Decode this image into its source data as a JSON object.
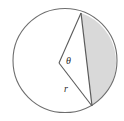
{
  "figure": {
    "kind": "geometry-diagram",
    "canvas": {
      "width": 124,
      "height": 121,
      "background": "#ffffff"
    },
    "colors": {
      "stroke": "#6e6e6e",
      "stroke_dark": "#4a4a4a",
      "circle_fill": "#ffffff",
      "segment_fill": "#d9d9d9",
      "label_color": "#2b2b2b"
    },
    "circle": {
      "name": "outer-circle",
      "center_x": 65,
      "center_y": 60.5,
      "radius": 52,
      "stroke_width": 1.1
    },
    "chord": {
      "name": "chord",
      "x1": 81,
      "y1": 13,
      "x2": 92,
      "y2": 106,
      "stroke_width": 1.2
    },
    "vertex": {
      "name": "angle-vertex",
      "x": 59,
      "y": 63
    },
    "radii": [
      {
        "name": "radius-upper",
        "x1": 59,
        "y1": 63,
        "x2": 81,
        "y2": 13
      },
      {
        "name": "radius-lower",
        "x1": 59,
        "y1": 63,
        "x2": 92,
        "y2": 106
      }
    ],
    "segment_path": "M 81 13 A 52 52 0 0 1 92 106 L 81 13 Z",
    "labels": {
      "theta": {
        "text": "θ",
        "x": 68.5,
        "y": 61.5
      },
      "radius": {
        "text": "r",
        "x": 66,
        "y": 90
      }
    }
  }
}
